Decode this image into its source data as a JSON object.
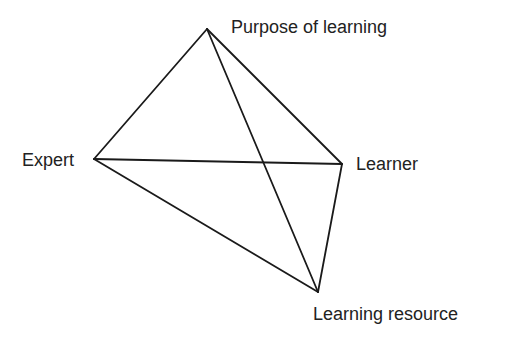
{
  "diagram": {
    "type": "tetrahedron-relationship",
    "nodes": [
      {
        "id": "purpose",
        "label": "Purpose of learning",
        "x": 207,
        "y": 29
      },
      {
        "id": "expert",
        "label": "Expert",
        "x": 94,
        "y": 159
      },
      {
        "id": "learner",
        "label": "Learner",
        "x": 342,
        "y": 164
      },
      {
        "id": "resource",
        "label": "Learning resource",
        "x": 318,
        "y": 292
      }
    ],
    "edges": [
      [
        "purpose",
        "expert"
      ],
      [
        "purpose",
        "learner"
      ],
      [
        "purpose",
        "resource"
      ],
      [
        "expert",
        "learner"
      ],
      [
        "expert",
        "resource"
      ],
      [
        "learner",
        "resource"
      ]
    ],
    "line_color": "#1a1a1a",
    "text_color": "#222222"
  }
}
